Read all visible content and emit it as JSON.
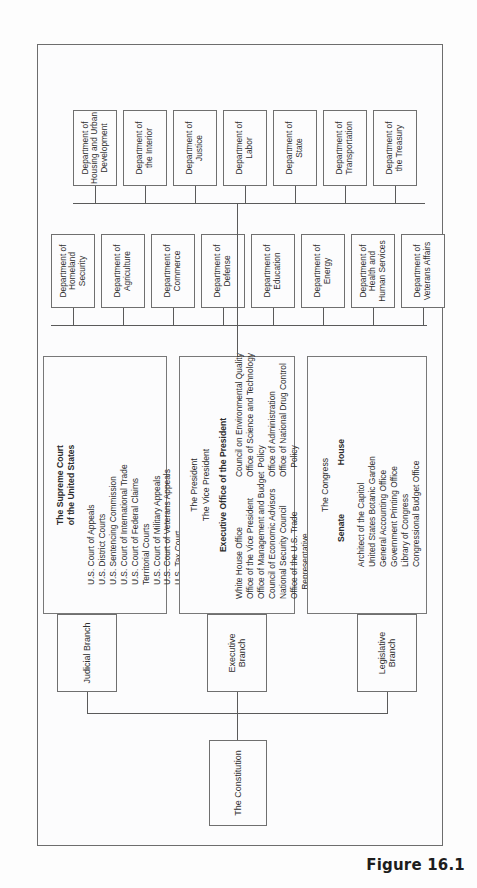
{
  "figure": {
    "caption": "Figure 16.1",
    "root_label": "The Constitution"
  },
  "branches": [
    {
      "id": "legislative",
      "label": "Legislative Branch"
    },
    {
      "id": "executive",
      "label": "Executive Branch"
    },
    {
      "id": "judicial",
      "label": "Judicial Branch"
    }
  ],
  "legislative": {
    "heading": "The Congress",
    "chambers": [
      "Senate",
      "House"
    ],
    "agencies": [
      "Architect of the Capitol",
      "United States Botanic Garden",
      "General Accounting Office",
      "Government Printing Office",
      "Library of Congress",
      "Congressional Budget Office"
    ]
  },
  "executive": {
    "officers": [
      "The President",
      "The Vice President"
    ],
    "eop_heading": "Executive Office of the President",
    "eop_left": [
      "White House Office",
      "Office of the Vice President",
      "Office of Management and Budget",
      "Council of Economic Advisors",
      "National Security Council",
      "Office of the U.S. Trade",
      "    Representative"
    ],
    "eop_right": [
      "Council on Environmental Quality",
      "Office of Science and Technology",
      "    Policy",
      "Office of Administration",
      "Office of National Drug Control",
      "    Policy"
    ]
  },
  "judicial": {
    "heading_line1": "The Supreme Court",
    "heading_line2": "of the United States",
    "courts": [
      "U.S. Court of Appeals",
      "U.S. District Courts",
      "U.S. Sentencing Commission",
      "U.S. Court of International Trade",
      "U.S. Court of Federal Claims",
      "Territorial Courts",
      "U.S. Court of Military Appeals",
      "U.S. Court of Veterans Appeals",
      "U.S. Tax Court",
      "Administrative Office of the",
      "    U.S. Courts",
      "Federal Judicial Center"
    ]
  },
  "departments_row_upper": [
    "Department of\nHomeland\nSecurity",
    "Department of\nAgriculture",
    "Department of\nCommerce",
    "Department of\nDefense",
    "Department of\nEducation",
    "Department of\nEnergy",
    "Department of\nHealth and\nHuman Services",
    "Department of\nVeterans Affairs"
  ],
  "departments_row_lower": [
    "Department of\nHousing and Urban\nDevelopment",
    "Department of\nthe Interior",
    "Department of\nJustice",
    "Department of\nLabor",
    "Department of\nState",
    "Department of\nTransportation",
    "Department of\nthe Treasury"
  ],
  "colors": {
    "page_background": "#fdfdfd",
    "panel_background": "#fcfcfd",
    "line": "#5a5a5a",
    "border": "#6f6f6f",
    "text": "#2f2f2f"
  }
}
